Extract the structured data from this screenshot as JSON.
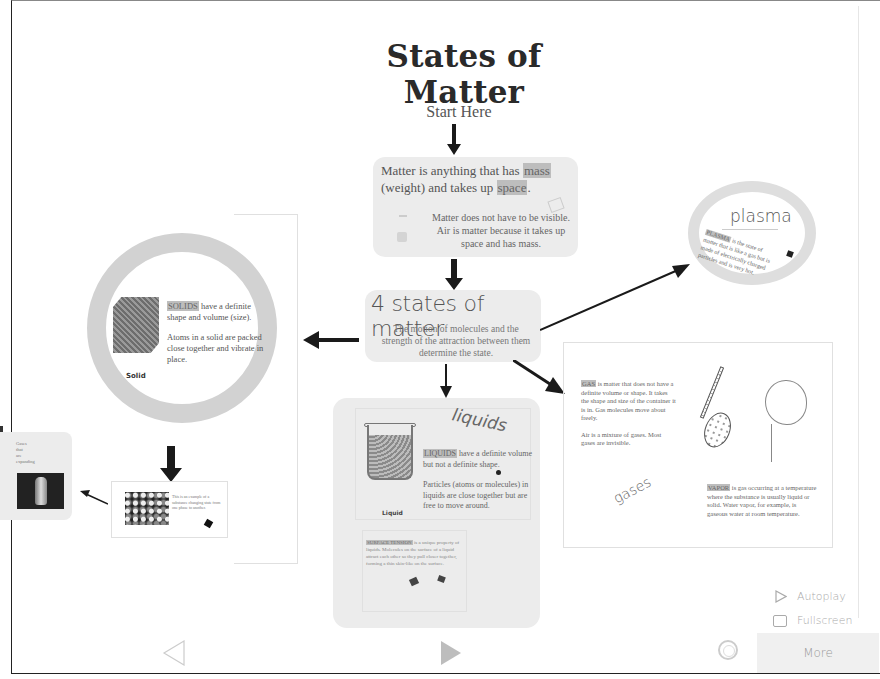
{
  "presentation": {
    "title": "States of Matter",
    "subtitle": "Start Here"
  },
  "matter_card": {
    "main_prefix": "Matter is anything that has ",
    "main_hl1": "mass",
    "main_mid": " (weight) and takes up ",
    "main_hl2": "space",
    "main_suffix": ".",
    "sub": "Matter does not have to be visible. Air is matter because it takes up space and has mass."
  },
  "states_card": {
    "heading": "4 states of matter",
    "sub": "The motion of molecules and the strength of the attraction between them determine the state."
  },
  "solid": {
    "label": "Solid",
    "hl": "SOLIDS",
    "text1": " have a definite shape and volume (size).",
    "text2": "Atoms in a solid are packed close together and vibrate in place."
  },
  "plasma": {
    "title": "plasma",
    "hl": "PLASMA",
    "text": " is the state of matter that is like a gas but is made of electrically charged particles and is very hot."
  },
  "liquids": {
    "title": "liquids",
    "label": "Liquid",
    "hl": "LIQUIDS",
    "text1": " have a definite volume but not a definite shape.",
    "text2": "Particles (atoms or molecules) in liquids are close together but are free to move around.",
    "sub_hl": "SURFACE TENSION",
    "sub": " is a unique property of liquids. Molecules on the surface of a liquid attract each other so they pull closer together, forming a thin skin-like on the surface."
  },
  "gases": {
    "title": "gases",
    "hl": "GAS",
    "text1": " is matter that does not have a definite volume or shape. It takes the shape and size of the container it is in. Gas molecules move about freely.",
    "text2": "Air is a mixture of gases. Most gases are invisible.",
    "vapor_hl": "VAPOR",
    "vapor_text": " is gas occurring at a temperature where the substance is usually liquid or solid. Water vapor, for example, is gaseous water at room temperature."
  },
  "thumb": {
    "text": "Gases\nthat\nare\nexpanding"
  },
  "mini": {
    "text": "This is an example of a substance changing state from one phase to another."
  },
  "controls": {
    "autoplay": "Autoplay",
    "fullscreen": "Fullscreen",
    "more": "More"
  },
  "colors": {
    "card_bg": "#ececec",
    "ring": "#d2d2d2",
    "arrow": "#1a1a1a",
    "control_text": "#aaaaaa"
  }
}
